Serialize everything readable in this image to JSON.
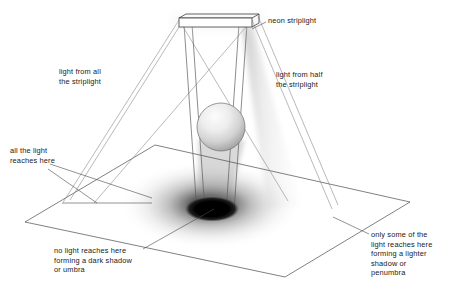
{
  "figure": {
    "background_color": "#ffffff",
    "line_color": "#555555",
    "text_color": "#191919",
    "umbra_color": "#000000",
    "penumbra_color": "#8f8f8f",
    "sphere_fill_light": "#f2f2f2",
    "sphere_fill_dark": "#9a9a9a"
  },
  "labels": {
    "striplight": "neon striplight",
    "light_all": "light from all\nthe striplight",
    "light_half": "light from half\nthe striplight",
    "all_light_reaches": "all the light\nreaches here",
    "umbra": "no light reaches here\nforming a dark shadow\nor umbra",
    "penumbra": "only some of the\nlight reaches here\nforming a lighter\nshadow or\npenumbra"
  },
  "scene": {
    "striplight": {
      "name": "neon striplight",
      "front_top_left": [
        179,
        18
      ],
      "front_top_right": [
        252,
        18
      ],
      "front_bottom_left": [
        179,
        27
      ],
      "front_bottom_right": [
        252,
        27
      ],
      "back_top_left": [
        186,
        14
      ],
      "back_top_right": [
        259,
        14
      ]
    },
    "sphere": {
      "name": "occluding sphere",
      "center": [
        221,
        127
      ],
      "radius": 24
    },
    "ground_plane": {
      "name": "receiving ground plane",
      "corners": [
        [
          155,
          145
        ],
        [
          410,
          202
        ],
        [
          285,
          277
        ],
        [
          25,
          222
        ]
      ]
    },
    "umbra_ellipse": {
      "name": "umbra",
      "center": [
        212,
        209
      ],
      "rx": 26,
      "ry": 12
    },
    "penumbra_ellipse": {
      "name": "penumbra",
      "center": [
        210,
        205
      ],
      "rx": 92,
      "ry": 45
    },
    "penumbra_beam": {
      "name": "half-light beam",
      "points": [
        [
          243,
          24
        ],
        [
          252,
          24
        ],
        [
          300,
          205
        ],
        [
          270,
          207
        ]
      ]
    },
    "light_rays": [
      {
        "from": [
          179,
          20
        ],
        "to": [
          63,
          203
        ]
      },
      {
        "from": [
          179,
          20
        ],
        "to": [
          285,
          200
        ]
      },
      {
        "from": [
          252,
          20
        ],
        "to": [
          330,
          208
        ]
      },
      {
        "from": [
          252,
          20
        ],
        "to": [
          95,
          202
        ]
      },
      {
        "from": [
          186,
          22
        ],
        "to": [
          196,
          216
        ]
      },
      {
        "from": [
          245,
          22
        ],
        "to": [
          232,
          214
        ]
      }
    ],
    "leaders": [
      {
        "name": "striplight-leader",
        "from": [
          266,
          22
        ],
        "to": [
          250,
          30
        ]
      },
      {
        "name": "all-light-leader",
        "from": [
          50,
          168
        ],
        "to": [
          96,
          203
        ]
      },
      {
        "name": "all-light-leader-2",
        "from": [
          52,
          163
        ],
        "to": [
          150,
          198
        ]
      },
      {
        "name": "umbra-leader",
        "from": [
          144,
          249
        ],
        "to": [
          213,
          208
        ]
      },
      {
        "name": "penumbra-leader",
        "from": [
          369,
          233
        ],
        "to": [
          336,
          217
        ]
      }
    ]
  }
}
